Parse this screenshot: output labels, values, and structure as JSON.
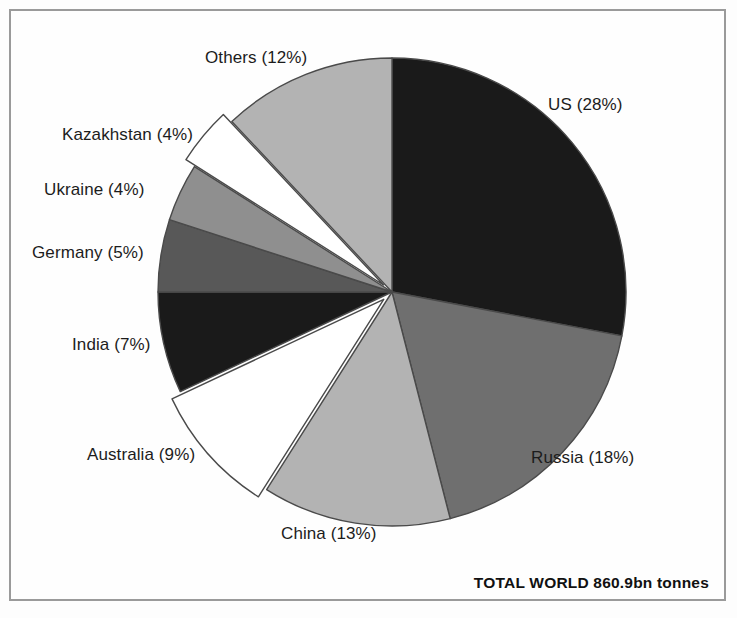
{
  "figure": {
    "background_color": "#fefefe",
    "frame_color": "#9a9a9a",
    "total_note": "TOTAL WORLD 860.9bn tonnes"
  },
  "chart_data": {
    "type": "pie",
    "title": "",
    "subtitle": "",
    "annotation": "TOTAL WORLD 860.9bn tonnes",
    "units": "percent of world total",
    "total_label": "860.9bn tonnes",
    "start_angle_deg": 0,
    "direction": "clockwise",
    "legend": "none (direct slice labels)",
    "categories": [
      "US",
      "Russia",
      "China",
      "Australia",
      "India",
      "Germany",
      "Ukraine",
      "Kazakhstan",
      "Others"
    ],
    "values": [
      28,
      18,
      13,
      9,
      7,
      5,
      4,
      4,
      12
    ],
    "labels": [
      "US (28%)",
      "Russia (18%)",
      "China (13%)",
      "Australia (9%)",
      "India (7%)",
      "Germany (5%)",
      "Ukraine (4%)",
      "Kazakhstan (4%)",
      "Others (12%)"
    ],
    "colors": [
      "#1a1a1a",
      "#6f6f6f",
      "#b3b3b3",
      "#ffffff",
      "#1a1a1a",
      "#585858",
      "#8f8f8f",
      "#ffffff",
      "#b3b3b3"
    ],
    "slice_outline_color": "#4a4a4a",
    "slices": [
      {
        "name": "US",
        "percent": 28,
        "label": "US (28%)",
        "color": "#1a1a1a",
        "exploded": false
      },
      {
        "name": "Russia",
        "percent": 18,
        "label": "Russia (18%)",
        "color": "#6f6f6f",
        "exploded": false
      },
      {
        "name": "China",
        "percent": 13,
        "label": "China (13%)",
        "color": "#b3b3b3",
        "exploded": false
      },
      {
        "name": "Australia",
        "percent": 9,
        "label": "Australia (9%)",
        "color": "#ffffff",
        "exploded": true
      },
      {
        "name": "India",
        "percent": 7,
        "label": "India (7%)",
        "color": "#1a1a1a",
        "exploded": false
      },
      {
        "name": "Germany",
        "percent": 5,
        "label": "Germany (5%)",
        "color": "#585858",
        "exploded": false
      },
      {
        "name": "Ukraine",
        "percent": 4,
        "label": "Ukraine (4%)",
        "color": "#8f8f8f",
        "exploded": false
      },
      {
        "name": "Kazakhstan",
        "percent": 4,
        "label": "Kazakhstan (4%)",
        "color": "#ffffff",
        "exploded": true
      },
      {
        "name": "Others",
        "percent": 12,
        "label": "Others (12%)",
        "color": "#b3b3b3",
        "exploded": false
      }
    ]
  }
}
